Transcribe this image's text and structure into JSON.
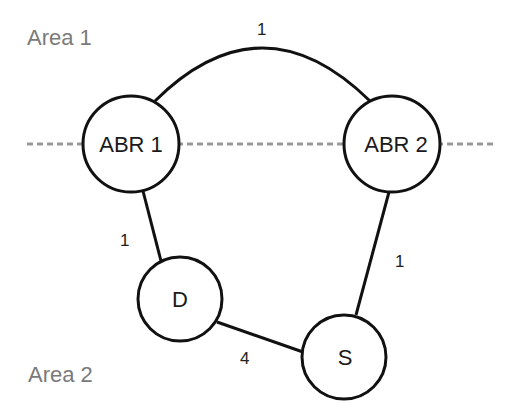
{
  "areas": {
    "area1": {
      "label": "Area 1"
    },
    "area2": {
      "label": "Area 2"
    },
    "boundary_color": "#999999"
  },
  "nodes": [
    {
      "id": "abr1",
      "label": "ABR 1",
      "cx": 131,
      "cy": 144,
      "r": 48
    },
    {
      "id": "abr2",
      "label": "ABR 2",
      "cx": 392,
      "cy": 144,
      "r": 48
    },
    {
      "id": "d",
      "label": "D",
      "cx": 180,
      "cy": 299,
      "r": 42
    },
    {
      "id": "s",
      "label": "S",
      "cx": 344,
      "cy": 357,
      "r": 42
    }
  ],
  "links": [
    {
      "from": "ABR 1",
      "to": "ABR 2",
      "cost": "1",
      "area": "Area 1"
    },
    {
      "from": "ABR 1",
      "to": "D",
      "cost": "1",
      "area": "Area 2"
    },
    {
      "from": "ABR 2",
      "to": "S",
      "cost": "1",
      "area": "Area 2"
    },
    {
      "from": "D",
      "to": "S",
      "cost": "4",
      "area": "Area 2"
    }
  ],
  "colors": {
    "stroke": "#111111",
    "area_text": "#7a7a7a",
    "text": "#1a1a1a",
    "background": "#ffffff"
  }
}
